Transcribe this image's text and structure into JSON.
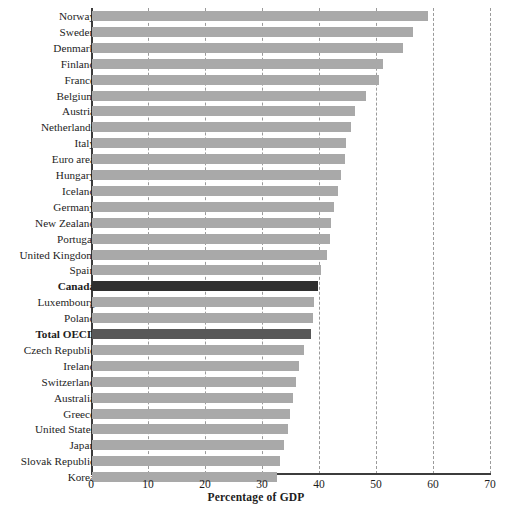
{
  "chart_data": {
    "type": "bar",
    "orientation": "horizontal",
    "title": "",
    "xlabel": "Percentage of GDP",
    "ylabel": "",
    "xlim": [
      0,
      70
    ],
    "xticks": [
      0,
      10,
      20,
      30,
      40,
      50,
      60,
      70
    ],
    "grid": "vertical-dashed",
    "legend": "none",
    "bar_color": "#a9a9a9",
    "highlight_colors": {
      "Canada": "#2f2f2f",
      "Total OECD": "#585858"
    },
    "categories": [
      "Norway",
      "Sweden",
      "Denmark",
      "Finland",
      "France",
      "Belgium",
      "Austria",
      "Netherlands",
      "Italy",
      "Euro area",
      "Hungary",
      "Iceland",
      "Germany",
      "New Zealand",
      "Portugal",
      "United Kingdom",
      "Spain",
      "Canada",
      "Luxembourg",
      "Poland",
      "Total OECD",
      "Czech Republic",
      "Ireland",
      "Switzerland",
      "Australia",
      "Greece",
      "United States",
      "Japan",
      "Slovak Republic",
      "Korea"
    ],
    "values": [
      59.0,
      56.4,
      54.6,
      51.0,
      50.4,
      48.0,
      46.1,
      45.4,
      44.6,
      44.4,
      43.7,
      43.2,
      42.4,
      42.0,
      41.7,
      41.3,
      40.2,
      39.7,
      39.0,
      38.7,
      38.5,
      37.2,
      36.4,
      35.8,
      35.2,
      34.8,
      34.3,
      33.6,
      33.0,
      32.5
    ],
    "highlighted": [
      "Canada",
      "Total OECD"
    ]
  }
}
